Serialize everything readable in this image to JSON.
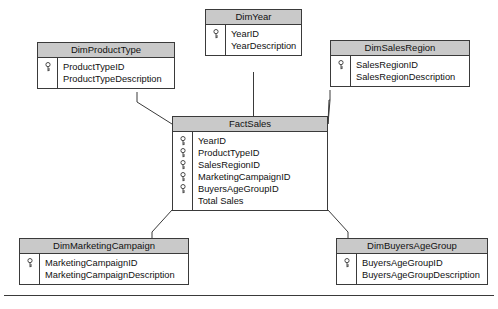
{
  "diagram": {
    "type": "star-schema-erd",
    "title": "",
    "key_icon": "key-icon",
    "colors": {
      "header_fill": "#c9c9c9",
      "border": "#3a3a3a",
      "body_fill": "#ffffff",
      "text": "#111111",
      "connector": "#3a3a3a"
    }
  },
  "tables": [
    {
      "id": "dim-year",
      "name": "DimYear",
      "fields": [
        {
          "label": "YearID",
          "key": true
        },
        {
          "label": "YearDescription",
          "key": false
        }
      ]
    },
    {
      "id": "dim-product-type",
      "name": "DimProductType",
      "fields": [
        {
          "label": "ProductTypeID",
          "key": true
        },
        {
          "label": "ProductTypeDescription",
          "key": false
        }
      ]
    },
    {
      "id": "dim-sales-region",
      "name": "DimSalesRegion",
      "fields": [
        {
          "label": "SalesRegionID",
          "key": true
        },
        {
          "label": "SalesRegionDescription",
          "key": false
        }
      ]
    },
    {
      "id": "fact-sales",
      "name": "FactSales",
      "fields": [
        {
          "label": "YearID",
          "key": true
        },
        {
          "label": "ProductTypeID",
          "key": true
        },
        {
          "label": "SalesRegionID",
          "key": true
        },
        {
          "label": "MarketingCampaignID",
          "key": true
        },
        {
          "label": "BuyersAgeGroupID",
          "key": true
        },
        {
          "label": "Total Sales",
          "key": false
        }
      ]
    },
    {
      "id": "dim-marketing-campaign",
      "name": "DimMarketingCampaign",
      "fields": [
        {
          "label": "MarketingCampaignID",
          "key": true
        },
        {
          "label": "MarketingCampaignDescription",
          "key": false
        }
      ]
    },
    {
      "id": "dim-buyers-age-group",
      "name": "DimBuyersAgeGroup",
      "fields": [
        {
          "label": "BuyersAgeGroupID",
          "key": true
        },
        {
          "label": "BuyersAgeGroupDescription",
          "key": false
        }
      ]
    }
  ],
  "relationships": [
    {
      "from": "dim-year",
      "to": "fact-sales"
    },
    {
      "from": "dim-product-type",
      "to": "fact-sales"
    },
    {
      "from": "dim-sales-region",
      "to": "fact-sales"
    },
    {
      "from": "dim-marketing-campaign",
      "to": "fact-sales"
    },
    {
      "from": "dim-buyers-age-group",
      "to": "fact-sales"
    }
  ]
}
